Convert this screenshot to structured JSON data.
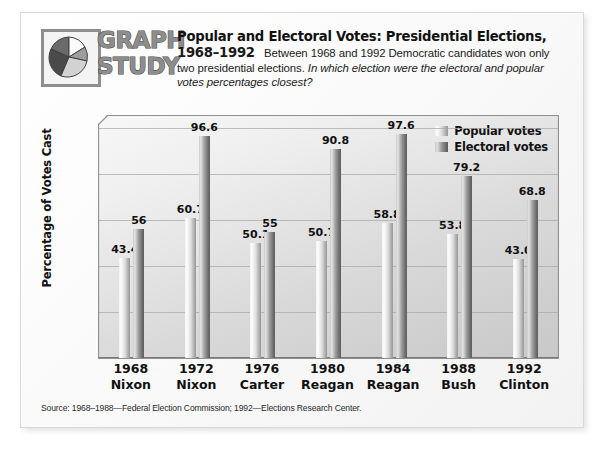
{
  "logo": {
    "word1": "GRAPH",
    "word2": "STUDY",
    "icon": "pie-chart-icon"
  },
  "header": {
    "title": "Popular and Electoral Votes:  Presidential Elections,",
    "years": "1968–1992",
    "body": "Between 1968 and 1992 Democratic candidates won only two presidential elections.",
    "question": "In which election were the electoral and popular votes percentages closest?"
  },
  "source": {
    "text": "Source: 1968–1988—Federal Election Commission; 1992—Elections Research Center."
  },
  "colors": {
    "popular": "#d8d8d8",
    "electoral": "#8a8a8a",
    "plot_background": "#d9d9d9",
    "text": "#111111"
  },
  "chart_data": {
    "type": "bar",
    "title": "Popular and Electoral Votes:  Presidential Elections, 1968–1992",
    "xlabel": "",
    "ylabel": "Percentage of Votes Cast",
    "ylim": [
      0,
      100
    ],
    "yticks": [
      0,
      20,
      40,
      60,
      80,
      100
    ],
    "grid": true,
    "legend_position": "top-right",
    "categories": [
      "1968",
      "1972",
      "1976",
      "1980",
      "1984",
      "1988",
      "1992"
    ],
    "category_sublabels": [
      "Nixon",
      "Nixon",
      "Carter",
      "Reagan",
      "Reagan",
      "Bush",
      "Clinton"
    ],
    "series": [
      {
        "name": "Popular votes",
        "values": [
          43.4,
          60.7,
          50.1,
          50.7,
          58.8,
          53.8,
          43.0
        ],
        "labels": [
          "43.4",
          "60.7",
          "50.1",
          "50.7",
          "58.8",
          "53.8",
          "43.0"
        ]
      },
      {
        "name": "Electoral votes",
        "values": [
          56,
          96.6,
          55,
          90.8,
          97.6,
          79.2,
          68.8
        ],
        "labels": [
          "56",
          "96.6",
          "55",
          "90.8",
          "97.6",
          "79.2",
          "68.8"
        ]
      }
    ]
  }
}
